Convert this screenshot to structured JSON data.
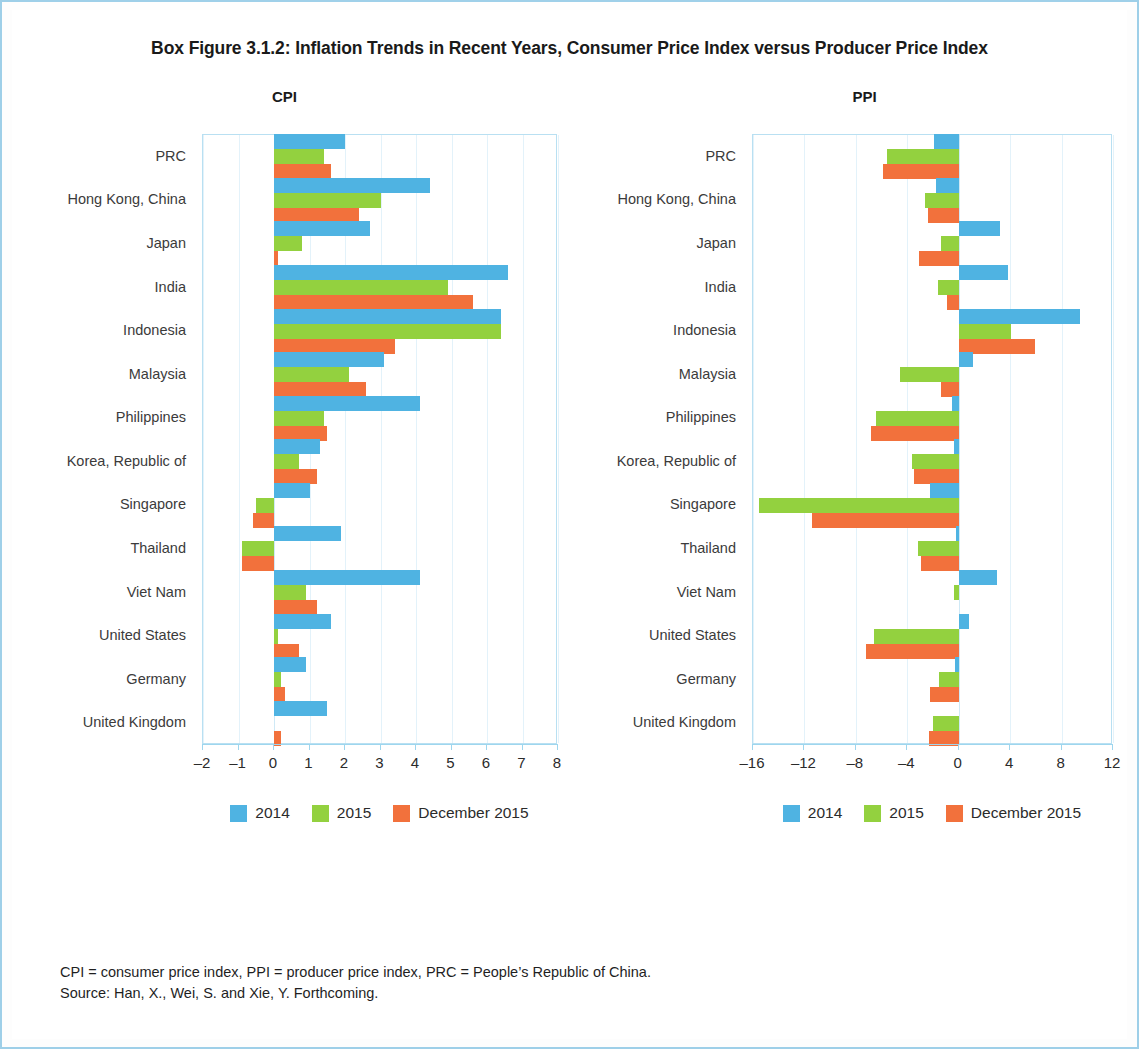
{
  "figure": {
    "title": "Box Figure 3.1.2:  Inflation Trends in Recent Years, Consumer Price Index versus Producer Price Index",
    "notes_line1": "CPI = consumer price index, PPI = producer price index, PRC = People’s Republic of China.",
    "notes_line2": "Source:  Han, X., Wei, S. and Xie, Y. Forthcoming."
  },
  "colors": {
    "series_2014": "#4fb3e2",
    "series_2015": "#93d13f",
    "series_december_2015": "#f2713c",
    "grid": "#e3f2fa",
    "axis": "#9ed6ee",
    "page_border": "#9ecfe8"
  },
  "legend": {
    "items": [
      {
        "label": "2014",
        "color_key": "s0"
      },
      {
        "label": "2015",
        "color_key": "s1"
      },
      {
        "label": "December 2015",
        "color_key": "s2"
      }
    ]
  },
  "chart_data": [
    {
      "type": "bar",
      "orientation": "horizontal",
      "title": "CPI",
      "xlabel": "",
      "ylabel": "",
      "xlim": [
        -2,
        8
      ],
      "xticks": [
        -2,
        -1,
        0,
        1,
        2,
        3,
        4,
        5,
        6,
        7,
        8
      ],
      "xticklabels": [
        "–2",
        "–1",
        "0",
        "1",
        "2",
        "3",
        "4",
        "5",
        "6",
        "7",
        "8"
      ],
      "grid": true,
      "legend_position": "bottom",
      "categories": [
        "PRC",
        "Hong Kong, China",
        "Japan",
        "India",
        "Indonesia",
        "Malaysia",
        "Philippines",
        "Korea, Republic of",
        "Singapore",
        "Thailand",
        "Viet Nam",
        "United States",
        "Germany",
        "United Kingdom"
      ],
      "series": [
        {
          "name": "2014",
          "color": "#4fb3e2",
          "values": [
            2.0,
            4.4,
            2.7,
            6.6,
            6.4,
            3.1,
            4.1,
            1.3,
            1.0,
            1.9,
            4.1,
            1.6,
            0.9,
            1.5
          ]
        },
        {
          "name": "2015",
          "color": "#93d13f",
          "values": [
            1.4,
            3.0,
            0.8,
            4.9,
            6.4,
            2.1,
            1.4,
            0.7,
            -0.5,
            -0.9,
            0.9,
            0.1,
            0.2,
            0.0
          ]
        },
        {
          "name": "December 2015",
          "color": "#f2713c",
          "values": [
            1.6,
            2.4,
            0.1,
            5.6,
            3.4,
            2.6,
            1.5,
            1.2,
            -0.6,
            -0.9,
            1.2,
            0.7,
            0.3,
            0.2
          ]
        }
      ]
    },
    {
      "type": "bar",
      "orientation": "horizontal",
      "title": "PPI",
      "xlabel": "",
      "ylabel": "",
      "xlim": [
        -16,
        12
      ],
      "xticks": [
        -16,
        -12,
        -8,
        -4,
        0,
        4,
        8,
        12
      ],
      "xticklabels": [
        "–16",
        "–12",
        "–8",
        "–4",
        "0",
        "4",
        "8",
        "12"
      ],
      "grid": true,
      "legend_position": "bottom",
      "categories": [
        "PRC",
        "Hong Kong, China",
        "Japan",
        "India",
        "Indonesia",
        "Malaysia",
        "Philippines",
        "Korea, Republic of",
        "Singapore",
        "Thailand",
        "Viet Nam",
        "United States",
        "Germany",
        "United Kingdom"
      ],
      "series": [
        {
          "name": "2014",
          "color": "#4fb3e2",
          "values": [
            -1.9,
            -1.8,
            3.2,
            3.8,
            9.4,
            1.1,
            -0.5,
            -0.4,
            -2.2,
            -0.2,
            3.0,
            0.8,
            -0.3,
            0.0
          ]
        },
        {
          "name": "2015",
          "color": "#93d13f",
          "values": [
            -5.6,
            -2.6,
            -1.4,
            -1.6,
            4.1,
            -4.6,
            -6.4,
            -3.6,
            -15.5,
            -3.2,
            -0.4,
            -6.6,
            -1.5,
            -2.0
          ]
        },
        {
          "name": "December 2015",
          "color": "#f2713c",
          "values": [
            -5.9,
            -2.4,
            -3.1,
            -0.9,
            5.9,
            -1.4,
            -6.8,
            -3.5,
            -11.4,
            -2.9,
            0.0,
            -7.2,
            -2.2,
            -2.3
          ]
        }
      ]
    }
  ]
}
